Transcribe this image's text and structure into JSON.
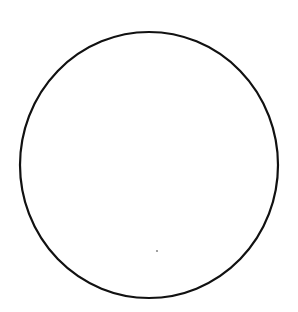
{
  "diagram": {
    "shape": "circle",
    "center_x": 149,
    "center_y": 165,
    "radius_x": 129,
    "radius_y": 133,
    "stroke_color": "#111111",
    "stroke_width": 2.2,
    "fill_color": "#ffffff",
    "background_color": "#ffffff",
    "dot": {
      "x": 157,
      "y": 251,
      "r": 1.1,
      "color": "#8a8a8a"
    }
  }
}
